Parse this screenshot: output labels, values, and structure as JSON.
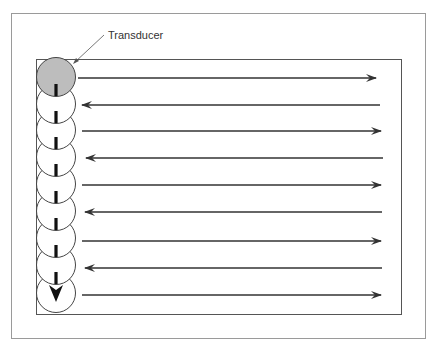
{
  "diagram": {
    "label": "Transducer",
    "colors": {
      "frame": "#9a9a9a",
      "inner_box": "#555555",
      "arrow": "#333333",
      "transducer_fill": "#bdbdbd",
      "circle_stroke": "#444444",
      "path_marker": "#111111"
    },
    "outer_frame": {
      "x": 11,
      "y": 13,
      "w": 414,
      "h": 325
    },
    "inner_box": {
      "x": 36,
      "y": 59,
      "w": 365,
      "h": 255
    },
    "transducer_positions": [
      {
        "index": 1,
        "cy": 77,
        "highlighted": true
      },
      {
        "index": 2,
        "cy": 104
      },
      {
        "index": 3,
        "cy": 130
      },
      {
        "index": 4,
        "cy": 157
      },
      {
        "index": 5,
        "cy": 184
      },
      {
        "index": 6,
        "cy": 211
      },
      {
        "index": 7,
        "cy": 238
      },
      {
        "index": 8,
        "cy": 265
      },
      {
        "index": 9,
        "cy": 293,
        "end_marker": "down-arrow"
      }
    ],
    "scan_lines": [
      {
        "y": 78,
        "direction": "right",
        "x1": 78,
        "x2": 376
      },
      {
        "y": 105,
        "direction": "left",
        "x1": 82,
        "x2": 380
      },
      {
        "y": 131,
        "direction": "right",
        "x1": 82,
        "x2": 381
      },
      {
        "y": 158,
        "direction": "left",
        "x1": 86,
        "x2": 383
      },
      {
        "y": 185,
        "direction": "right",
        "x1": 82,
        "x2": 381
      },
      {
        "y": 212,
        "direction": "left",
        "x1": 85,
        "x2": 382
      },
      {
        "y": 241,
        "direction": "right",
        "x1": 82,
        "x2": 381
      },
      {
        "y": 268,
        "direction": "left",
        "x1": 85,
        "x2": 382
      },
      {
        "y": 295,
        "direction": "right",
        "x1": 82,
        "x2": 381
      }
    ]
  }
}
